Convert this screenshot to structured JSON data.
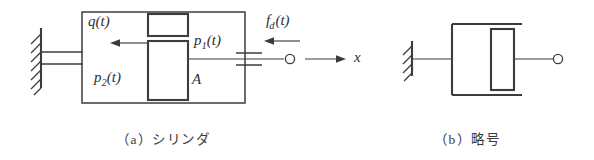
{
  "figure": {
    "background_color": "#ffffff",
    "line_color": "#3b3b42",
    "panel_a": {
      "caption": "（a）シリンダ",
      "labels": {
        "flow": {
          "base": "q",
          "args": "(t)"
        },
        "pressure_1": {
          "base": "p",
          "sub": "1",
          "args": "(t)"
        },
        "pressure_2": {
          "base": "p",
          "sub": "2",
          "args": "(t)"
        },
        "area": "A",
        "force": {
          "base": "f",
          "sub": "d",
          "args": "(t)"
        },
        "displacement": "x"
      }
    },
    "panel_b": {
      "caption": "（b）略号"
    }
  }
}
